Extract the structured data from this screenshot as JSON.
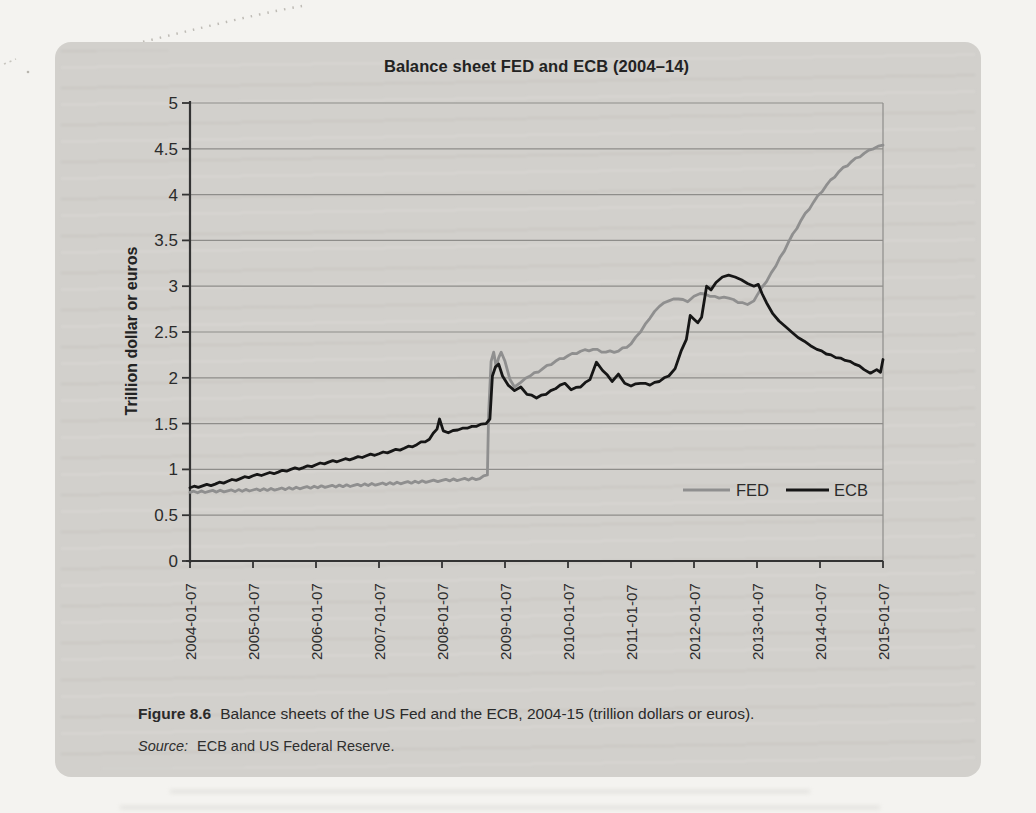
{
  "figure": {
    "chart": {
      "title": "Balance sheet FED and ECB (2004–14)",
      "y_axis_label": "Trillion dollar or euros",
      "y_ticks": [
        "5",
        "4.5",
        "4",
        "3.5",
        "3",
        "2.5",
        "2",
        "1.5",
        "1",
        "0.5",
        "0"
      ],
      "x_ticks": [
        "2004-01-07",
        "2005-01-07",
        "2006-01-07",
        "2007-01-07",
        "2008-01-07",
        "2009-01-07",
        "2010-01-07",
        "2011-01-07",
        "2012-01-07",
        "2013-01-07",
        "2014-01-07",
        "2015-01-07"
      ],
      "legend": {
        "items": [
          {
            "label": "FED",
            "color": "#8f8f8f"
          },
          {
            "label": "ECB",
            "color": "#161616"
          }
        ]
      }
    },
    "caption": {
      "label": "Figure 8.6",
      "text": "Balance sheets of the US Fed and the ECB, 2004-15 (trillion dollars or euros)."
    },
    "source": {
      "label": "Source:",
      "text": "ECB and US Federal Reserve."
    }
  },
  "chart_data": {
    "type": "line",
    "title": "Balance sheet FED and ECB (2004–14)",
    "xlabel": "",
    "ylabel": "Trillion dollar or euros",
    "ylim": [
      0,
      5
    ],
    "ytick_step": 0.5,
    "x_range": [
      2004,
      2015
    ],
    "x_tick_labels": [
      "2004-01-07",
      "2005-01-07",
      "2006-01-07",
      "2007-01-07",
      "2008-01-07",
      "2009-01-07",
      "2010-01-07",
      "2011-01-07",
      "2012-01-07",
      "2013-01-07",
      "2014-01-07",
      "2015-01-07"
    ],
    "grid": "horizontal every 0.5",
    "legend_position": "inside-bottom-right",
    "series": [
      {
        "name": "FED",
        "color": "#8f8f8f",
        "units": "trillion dollars",
        "x": [
          2004.0,
          2004.3,
          2004.6,
          2005.0,
          2005.4,
          2005.8,
          2006.2,
          2006.6,
          2007.0,
          2007.4,
          2007.8,
          2008.0,
          2008.3,
          2008.6,
          2008.72,
          2008.74,
          2008.78,
          2008.82,
          2008.86,
          2008.9,
          2008.94,
          2009.0,
          2009.08,
          2009.15,
          2009.25,
          2009.4,
          2009.6,
          2009.8,
          2010.0,
          2010.2,
          2010.4,
          2010.6,
          2010.8,
          2011.0,
          2011.15,
          2011.3,
          2011.45,
          2011.6,
          2011.75,
          2011.9,
          2012.0,
          2012.1,
          2012.25,
          2012.4,
          2012.55,
          2012.7,
          2012.85,
          2012.95,
          2013.0,
          2013.15,
          2013.3,
          2013.5,
          2013.7,
          2013.9,
          2014.1,
          2014.3,
          2014.5,
          2014.7,
          2014.85,
          2015.0
        ],
        "values": [
          0.75,
          0.76,
          0.765,
          0.775,
          0.785,
          0.8,
          0.815,
          0.825,
          0.84,
          0.855,
          0.87,
          0.88,
          0.89,
          0.9,
          0.94,
          1.6,
          2.18,
          2.28,
          2.12,
          2.22,
          2.28,
          2.18,
          1.98,
          1.9,
          1.95,
          2.02,
          2.1,
          2.18,
          2.24,
          2.29,
          2.31,
          2.28,
          2.29,
          2.37,
          2.5,
          2.65,
          2.78,
          2.84,
          2.86,
          2.83,
          2.89,
          2.92,
          2.89,
          2.87,
          2.87,
          2.82,
          2.8,
          2.84,
          2.9,
          3.05,
          3.22,
          3.48,
          3.72,
          3.92,
          4.1,
          4.25,
          4.36,
          4.45,
          4.5,
          4.54
        ]
      },
      {
        "name": "ECB",
        "color": "#161616",
        "units": "trillion euros",
        "x": [
          2004.0,
          2004.2,
          2004.4,
          2004.6,
          2004.8,
          2005.0,
          2005.2,
          2005.4,
          2005.6,
          2005.8,
          2006.0,
          2006.2,
          2006.4,
          2006.6,
          2006.8,
          2007.0,
          2007.2,
          2007.4,
          2007.6,
          2007.8,
          2007.92,
          2007.96,
          2008.02,
          2008.1,
          2008.25,
          2008.4,
          2008.55,
          2008.7,
          2008.76,
          2008.8,
          2008.85,
          2008.9,
          2008.96,
          2009.05,
          2009.15,
          2009.25,
          2009.35,
          2009.5,
          2009.65,
          2009.8,
          2009.95,
          2010.05,
          2010.2,
          2010.35,
          2010.45,
          2010.55,
          2010.7,
          2010.8,
          2010.9,
          2011.0,
          2011.15,
          2011.3,
          2011.45,
          2011.6,
          2011.7,
          2011.8,
          2011.88,
          2011.94,
          2012.0,
          2012.06,
          2012.12,
          2012.2,
          2012.27,
          2012.35,
          2012.45,
          2012.55,
          2012.65,
          2012.75,
          2012.85,
          2012.95,
          2013.02,
          2013.08,
          2013.15,
          2013.25,
          2013.35,
          2013.45,
          2013.55,
          2013.65,
          2013.75,
          2013.85,
          2013.95,
          2014.1,
          2014.25,
          2014.4,
          2014.55,
          2014.7,
          2014.8,
          2014.9,
          2014.96,
          2015.0
        ],
        "values": [
          0.8,
          0.82,
          0.84,
          0.87,
          0.9,
          0.93,
          0.95,
          0.97,
          1.0,
          1.02,
          1.05,
          1.08,
          1.1,
          1.12,
          1.15,
          1.17,
          1.2,
          1.23,
          1.27,
          1.33,
          1.44,
          1.55,
          1.42,
          1.4,
          1.43,
          1.45,
          1.47,
          1.5,
          1.55,
          2.02,
          2.12,
          2.15,
          2.02,
          1.92,
          1.86,
          1.9,
          1.82,
          1.78,
          1.82,
          1.88,
          1.94,
          1.87,
          1.9,
          1.98,
          2.17,
          2.08,
          1.96,
          2.04,
          1.94,
          1.91,
          1.94,
          1.92,
          1.96,
          2.02,
          2.1,
          2.3,
          2.42,
          2.68,
          2.64,
          2.6,
          2.66,
          3.0,
          2.96,
          3.04,
          3.1,
          3.12,
          3.1,
          3.07,
          3.03,
          3.0,
          3.02,
          2.92,
          2.82,
          2.7,
          2.62,
          2.56,
          2.5,
          2.44,
          2.4,
          2.35,
          2.31,
          2.26,
          2.22,
          2.19,
          2.15,
          2.09,
          2.05,
          2.09,
          2.06,
          2.2
        ]
      }
    ]
  }
}
